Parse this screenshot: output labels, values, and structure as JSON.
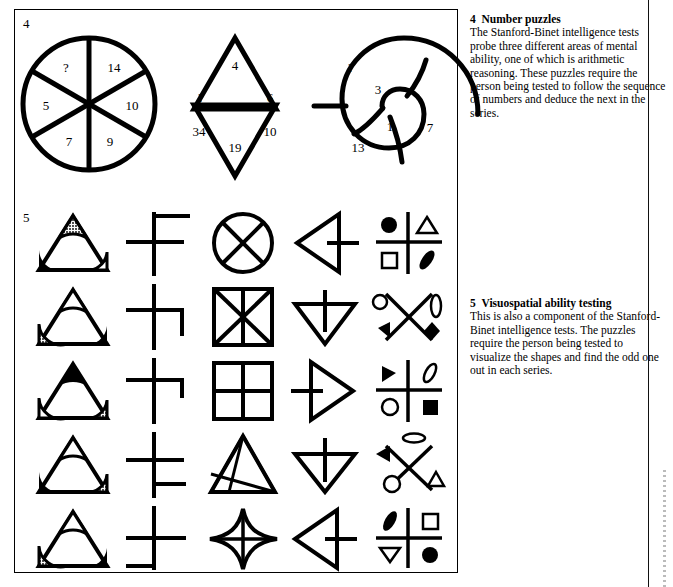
{
  "page": {
    "width": 673,
    "height": 587,
    "background": "#ffffff",
    "ink": "#000000"
  },
  "figures": [
    {
      "number": "4",
      "caption_title": "Number puzzles",
      "caption_body": "The Stanford-Binet intelligence tests probe three different areas of mental ability, one of which is arithmetic reasoning. These puzzles require the person being tested to follow the sequence of numbers and deduce the next in the series."
    },
    {
      "number": "5",
      "caption_title": "Visuospatial ability testing",
      "caption_body": "This is also a component of the Stanford-Binet intelligence tests. The puzzles require the person being tested to visualize the shapes and find the odd one out in each series."
    }
  ],
  "number_puzzles": [
    {
      "name": "wheel",
      "shape": "circle-six-sectors",
      "values": [
        "?",
        "14",
        "10",
        "9",
        "7",
        "5"
      ],
      "value_order": "clockwise from upper-left sector"
    },
    {
      "name": "star",
      "shape": "six-pointed-star",
      "values": [
        "4",
        "6",
        "10",
        "19",
        "34",
        "?"
      ],
      "value_order": "clockwise from top point"
    },
    {
      "name": "spiral",
      "shape": "snail-spiral",
      "values": [
        "?",
        "3",
        "1",
        "7",
        "13"
      ],
      "value_order": "outer to inner then around"
    }
  ],
  "visuospatial_rows": [
    {
      "row": 1,
      "cells": [
        {
          "type": "triangle-corners",
          "apex": "hatched",
          "left": "filled",
          "right": "open"
        },
        {
          "type": "cross",
          "variant": "f-shape"
        },
        {
          "type": "circle-x"
        },
        {
          "type": "arrow-triangle",
          "direction": "left"
        },
        {
          "type": "quadrant",
          "tl": "filled-circle",
          "tr": "open-triangle",
          "bl": "open-square",
          "br": "filled-leaf"
        }
      ]
    },
    {
      "row": 2,
      "cells": [
        {
          "type": "triangle-corners",
          "apex": "open",
          "left": "hatched",
          "right": "filled"
        },
        {
          "type": "cross",
          "variant": "step-right"
        },
        {
          "type": "square-hourglass"
        },
        {
          "type": "arrow-triangle",
          "direction": "down"
        },
        {
          "type": "x-quadrant",
          "tl": "open-circle",
          "tr": "open-ellipse",
          "bl": "filled-triangle",
          "br": "filled-diamond"
        }
      ]
    },
    {
      "row": 3,
      "cells": [
        {
          "type": "triangle-corners",
          "apex": "filled",
          "left": "open",
          "right": "hatched"
        },
        {
          "type": "cross",
          "variant": "t-shape"
        },
        {
          "type": "grid-four"
        },
        {
          "type": "arrow-triangle",
          "direction": "right"
        },
        {
          "type": "quadrant",
          "tl": "filled-left-triangle",
          "tr": "open-leaf",
          "bl": "open-circle",
          "br": "filled-square"
        }
      ]
    },
    {
      "row": 4,
      "cells": [
        {
          "type": "triangle-corners",
          "apex": "open",
          "left": "filled",
          "right": "hatched"
        },
        {
          "type": "cross",
          "variant": "step-lower-right"
        },
        {
          "type": "triangle-fan"
        },
        {
          "type": "arrow-triangle",
          "direction": "down"
        },
        {
          "type": "x-quadrant",
          "tl": "filled-triangle",
          "tr": "open-ellipse",
          "bl": "open-circle",
          "br": "open-triangle"
        }
      ]
    },
    {
      "row": 5,
      "cells": [
        {
          "type": "triangle-corners",
          "apex": "open",
          "left": "hatched",
          "right": "filled"
        },
        {
          "type": "cross",
          "variant": "f-shape-wide"
        },
        {
          "type": "four-point-star"
        },
        {
          "type": "arrow-triangle",
          "direction": "left"
        },
        {
          "type": "quadrant",
          "tl": "filled-leaf",
          "tr": "open-square",
          "bl": "open-triangle-down",
          "br": "filled-circle"
        }
      ]
    }
  ]
}
